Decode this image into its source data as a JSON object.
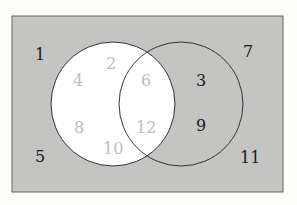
{
  "diagram": {
    "type": "venn",
    "colors": {
      "background": "#fdfdfb",
      "universe": "#c4c4c2",
      "setA": "#ffffff",
      "outline": "#333333",
      "dark_text": "#1a1a1a",
      "light_text": "#bdbdbd"
    },
    "universe": {
      "labels": [
        "1",
        "5",
        "7",
        "11"
      ]
    },
    "setA_only": {
      "labels": [
        "2",
        "4",
        "8",
        "10"
      ]
    },
    "intersection": {
      "labels": [
        "6",
        "12"
      ]
    },
    "setB_only": {
      "labels": [
        "3",
        "9"
      ]
    }
  }
}
